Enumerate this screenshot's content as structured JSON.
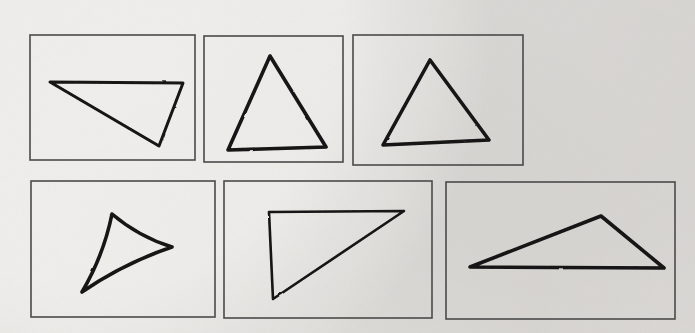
{
  "figure": {
    "width": 695,
    "height": 333,
    "background_color": "#f0efed",
    "frame_color": "#4a4a4a",
    "ink_color": "#141414",
    "rows": 2,
    "columns": 3
  },
  "panels": [
    {
      "id": "panel-1",
      "label": "Panel 1",
      "position": "top-left",
      "frame": {
        "x": 30,
        "y": 35,
        "width": 165,
        "height": 125
      },
      "shape": {
        "name": "obtuse triangle pointing down-right",
        "type": "triangle",
        "style": "straight",
        "stroke_width": 3,
        "vertices": [
          {
            "x": 50,
            "y": 82
          },
          {
            "x": 183,
            "y": 83
          },
          {
            "x": 159,
            "y": 146
          }
        ]
      }
    },
    {
      "id": "panel-2",
      "label": "Panel 2",
      "position": "top-center",
      "frame": {
        "x": 204,
        "y": 36,
        "width": 139,
        "height": 126
      },
      "shape": {
        "name": "upright isosceles triangle",
        "type": "triangle",
        "style": "straight",
        "stroke_width": 3.2,
        "vertices": [
          {
            "x": 270,
            "y": 56
          },
          {
            "x": 326,
            "y": 147
          },
          {
            "x": 228,
            "y": 150
          }
        ]
      }
    },
    {
      "id": "panel-3",
      "label": "Panel 3",
      "position": "top-right",
      "frame": {
        "x": 353,
        "y": 35,
        "width": 170,
        "height": 130
      },
      "shape": {
        "name": "tilted triangle apex right of center",
        "type": "triangle",
        "style": "straight",
        "stroke_width": 3.2,
        "vertices": [
          {
            "x": 430,
            "y": 60
          },
          {
            "x": 489,
            "y": 140
          },
          {
            "x": 383,
            "y": 145
          }
        ]
      }
    },
    {
      "id": "panel-4",
      "label": "Panel 4",
      "position": "bottom-left",
      "frame": {
        "x": 31,
        "y": 181,
        "width": 184,
        "height": 136
      },
      "shape": {
        "name": "rounded triangle pointing right",
        "type": "triangle",
        "style": "rounded",
        "stroke_width": 3.4,
        "vertices": [
          {
            "x": 112,
            "y": 214
          },
          {
            "x": 172,
            "y": 247
          },
          {
            "x": 82,
            "y": 292
          }
        ]
      }
    },
    {
      "id": "panel-5",
      "label": "Panel 5",
      "position": "bottom-center",
      "frame": {
        "x": 224,
        "y": 181,
        "width": 208,
        "height": 137
      },
      "shape": {
        "name": "right triangle pointing down-left",
        "type": "triangle",
        "style": "straight",
        "stroke_width": 2.8,
        "vertices": [
          {
            "x": 269,
            "y": 212
          },
          {
            "x": 404,
            "y": 211
          },
          {
            "x": 273,
            "y": 299
          }
        ]
      }
    },
    {
      "id": "panel-6",
      "label": "Panel 6",
      "position": "bottom-right",
      "frame": {
        "x": 446,
        "y": 182,
        "width": 229,
        "height": 137
      },
      "shape": {
        "name": "wide flat triangle apex right of center",
        "type": "triangle",
        "style": "straight",
        "stroke_width": 3.4,
        "vertices": [
          {
            "x": 470,
            "y": 267
          },
          {
            "x": 601,
            "y": 216
          },
          {
            "x": 664,
            "y": 268
          }
        ]
      }
    }
  ]
}
